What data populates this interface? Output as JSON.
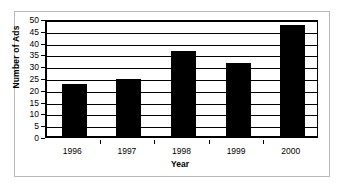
{
  "chart_data": {
    "type": "bar",
    "title": "",
    "categories": [
      "1996",
      "1997",
      "1998",
      "1999",
      "2000"
    ],
    "values": [
      22,
      24,
      36,
      31,
      47
    ],
    "xlabel": "Year",
    "ylabel": "Number of Ads",
    "ylim": [
      0,
      50
    ],
    "yticks": [
      0,
      5,
      10,
      15,
      20,
      25,
      30,
      35,
      40,
      45,
      50
    ],
    "ytick_labels": [
      "0",
      "5",
      "10",
      "15",
      "20",
      "25",
      "30",
      "35",
      "40",
      "45",
      "50"
    ],
    "grid": true,
    "legend": false,
    "bar_color": "#000000",
    "plot_background": "#ffffff",
    "frame_color": "#b9b9b9"
  }
}
